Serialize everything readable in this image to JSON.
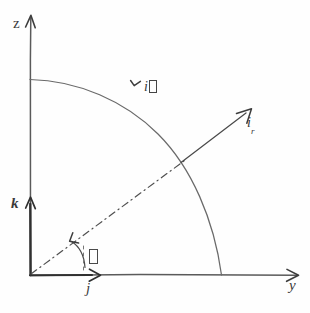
{
  "figure": {
    "type": "vector-diagram",
    "background_color": "#fefefe",
    "ink_color": "#4a4a4a",
    "width": 310,
    "height": 313
  },
  "axes": {
    "vertical": {
      "label": "z",
      "direction": "up",
      "origin": {
        "x": 30,
        "y": 275
      },
      "tip": {
        "x": 30,
        "y": 15
      }
    },
    "horizontal": {
      "label": "y",
      "direction": "right",
      "origin": {
        "x": 30,
        "y": 275
      },
      "tip": {
        "x": 297,
        "y": 275
      }
    }
  },
  "unit_vectors": [
    {
      "name": "k-vector",
      "label": "k",
      "description": "Cartesian unit vector along z axis",
      "from": {
        "x": 30,
        "y": 275
      },
      "to": {
        "x": 30,
        "y": 197
      }
    },
    {
      "name": "j-vector",
      "label": "j",
      "description": "Cartesian unit vector along y axis",
      "from": {
        "x": 30,
        "y": 275
      },
      "to": {
        "x": 99,
        "y": 275
      }
    },
    {
      "name": "i-r-vector",
      "label": "i",
      "subscript": "r",
      "description": "Radial unit vector",
      "from": {
        "x": 182,
        "y": 162
      },
      "to": {
        "x": 251,
        "y": 110
      }
    },
    {
      "name": "i-theta-vector",
      "label": "i",
      "subscript": "□",
      "description": "Transverse (theta) unit vector tangent to the arc",
      "tick": {
        "x": 133,
        "y": 84
      }
    }
  ],
  "arc": {
    "name": "quarter-circle-arc",
    "center": {
      "x": 30,
      "y": 275
    },
    "radius": 196,
    "start": {
      "x": 30,
      "y": 79
    },
    "end": {
      "x": 222,
      "y": 275
    }
  },
  "radial_line": {
    "name": "radial-dash-dot-line",
    "style": "dash-dot",
    "from": {
      "x": 30,
      "y": 275
    },
    "to": {
      "x": 185,
      "y": 160
    },
    "intersection_with_arc": {
      "x": 182,
      "y": 162
    }
  },
  "angle": {
    "name": "theta-angle",
    "symbol": "□",
    "description": "Polar angle measured from the y axis to the radial line",
    "arc_center": {
      "x": 79,
      "y": 275
    },
    "arc_radius": 36,
    "label_position": {
      "x": 89,
      "y": 249
    }
  },
  "labels": {
    "z": "z",
    "y": "y",
    "k": "k",
    "j": "j",
    "i_r_base": "i",
    "i_r_sub": "r",
    "i_theta_base": "i",
    "i_theta_sub": "□",
    "theta_symbol": "□"
  }
}
